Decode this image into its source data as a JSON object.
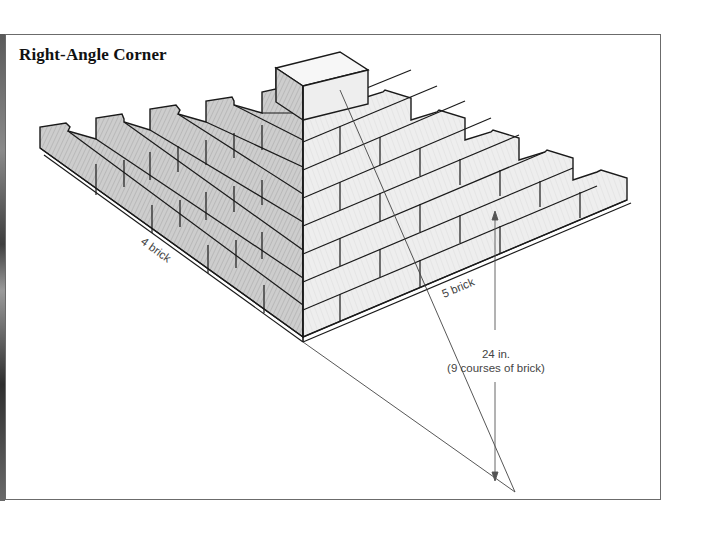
{
  "figure": {
    "title": "Right-Angle Corner",
    "labels": {
      "left_wall_length": "4 brick",
      "right_wall_length": "5 brick",
      "height_value": "24 in.",
      "height_note": "(9 courses of brick)"
    },
    "colors": {
      "frame": "#6b6b6b",
      "line": "#1a1a1a",
      "left_face": "#c9c9c9",
      "right_face": "#ececec",
      "top_face": "#f7f7f7",
      "dimension_line": "#555555"
    },
    "structure": {
      "courses": 9,
      "left_wall_bricks": 4,
      "right_wall_bricks": 5,
      "course_height_in": "24 in."
    }
  }
}
